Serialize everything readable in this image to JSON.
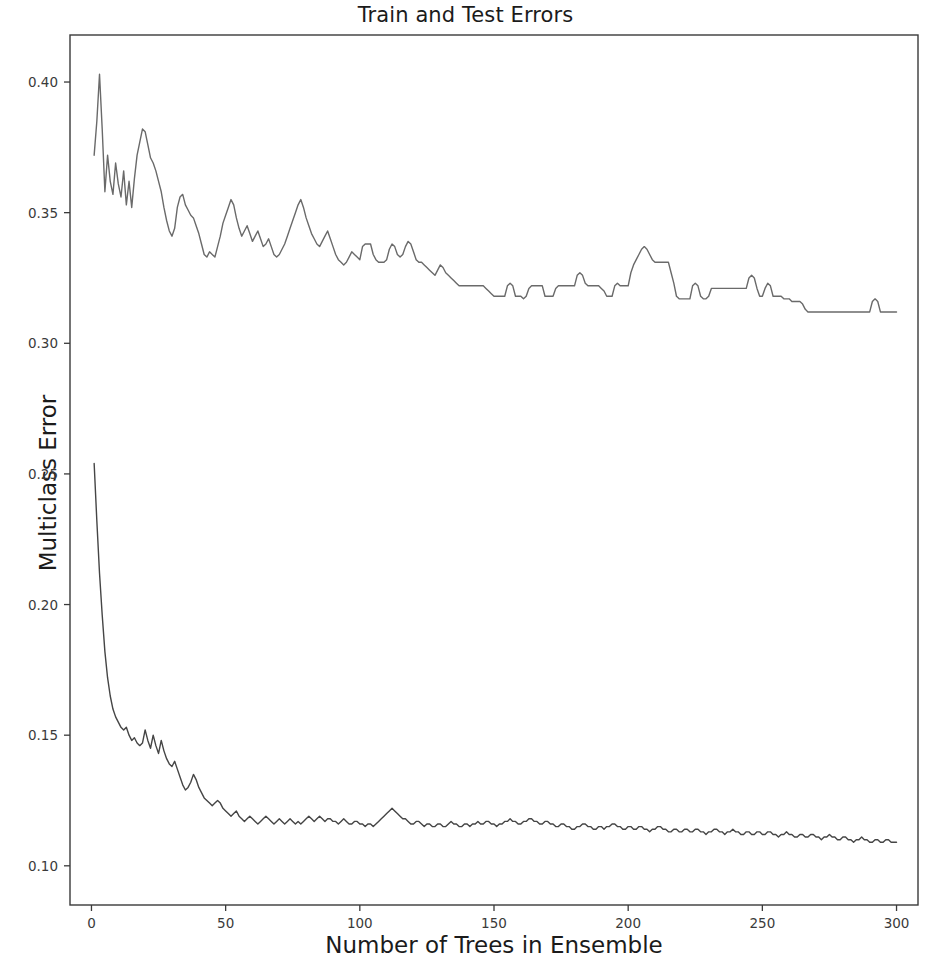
{
  "chart_data": {
    "type": "line",
    "title": "Train and Test Errors",
    "xlabel": "Number of Trees in Ensemble",
    "ylabel": "Multiclass Error",
    "xlim": [
      -8,
      308
    ],
    "ylim": [
      0.085,
      0.418
    ],
    "xticks": [
      0,
      50,
      100,
      150,
      200,
      250,
      300
    ],
    "xticklabels": [
      "0",
      "50",
      "100",
      "150",
      "200",
      "250",
      "300"
    ],
    "yticks": [
      0.1,
      0.15,
      0.2,
      0.25,
      0.3,
      0.35,
      0.4
    ],
    "yticklabels": [
      "0.10",
      "0.15",
      "0.20",
      "0.25",
      "0.30",
      "0.35",
      "0.40"
    ],
    "grid": false,
    "legend": null,
    "line_color": "#5f5f5f",
    "axis_color": "#3a3a3a",
    "background": "#ffffff",
    "series": [
      {
        "name": "Test Error",
        "color": "#6a6a6a",
        "x_start": 1,
        "x_step": 1,
        "values": [
          0.372,
          0.385,
          0.403,
          0.382,
          0.358,
          0.372,
          0.362,
          0.357,
          0.369,
          0.361,
          0.356,
          0.366,
          0.353,
          0.362,
          0.352,
          0.363,
          0.372,
          0.377,
          0.382,
          0.381,
          0.376,
          0.371,
          0.369,
          0.366,
          0.362,
          0.358,
          0.352,
          0.347,
          0.343,
          0.341,
          0.344,
          0.352,
          0.356,
          0.357,
          0.353,
          0.351,
          0.349,
          0.348,
          0.345,
          0.342,
          0.338,
          0.334,
          0.333,
          0.335,
          0.334,
          0.333,
          0.337,
          0.341,
          0.346,
          0.349,
          0.352,
          0.355,
          0.353,
          0.348,
          0.344,
          0.341,
          0.343,
          0.345,
          0.342,
          0.339,
          0.341,
          0.343,
          0.34,
          0.337,
          0.338,
          0.34,
          0.337,
          0.334,
          0.333,
          0.334,
          0.336,
          0.338,
          0.341,
          0.344,
          0.347,
          0.35,
          0.353,
          0.355,
          0.352,
          0.348,
          0.345,
          0.342,
          0.34,
          0.338,
          0.337,
          0.339,
          0.341,
          0.343,
          0.34,
          0.337,
          0.334,
          0.332,
          0.331,
          0.33,
          0.331,
          0.333,
          0.335,
          0.334,
          0.333,
          0.332,
          0.337,
          0.338,
          0.338,
          0.338,
          0.334,
          0.332,
          0.331,
          0.331,
          0.331,
          0.332,
          0.336,
          0.338,
          0.337,
          0.334,
          0.333,
          0.334,
          0.337,
          0.339,
          0.338,
          0.335,
          0.332,
          0.331,
          0.331,
          0.33,
          0.329,
          0.328,
          0.327,
          0.326,
          0.328,
          0.33,
          0.329,
          0.327,
          0.326,
          0.325,
          0.324,
          0.323,
          0.322,
          0.322,
          0.322,
          0.322,
          0.322,
          0.322,
          0.322,
          0.322,
          0.322,
          0.322,
          0.321,
          0.32,
          0.319,
          0.318,
          0.318,
          0.318,
          0.318,
          0.318,
          0.322,
          0.323,
          0.322,
          0.318,
          0.318,
          0.318,
          0.317,
          0.318,
          0.321,
          0.322,
          0.322,
          0.322,
          0.322,
          0.322,
          0.318,
          0.318,
          0.318,
          0.318,
          0.321,
          0.322,
          0.322,
          0.322,
          0.322,
          0.322,
          0.322,
          0.322,
          0.326,
          0.327,
          0.326,
          0.323,
          0.322,
          0.322,
          0.322,
          0.322,
          0.322,
          0.321,
          0.32,
          0.318,
          0.318,
          0.318,
          0.322,
          0.323,
          0.322,
          0.322,
          0.322,
          0.322,
          0.327,
          0.33,
          0.332,
          0.334,
          0.336,
          0.337,
          0.336,
          0.334,
          0.332,
          0.331,
          0.331,
          0.331,
          0.331,
          0.331,
          0.331,
          0.327,
          0.323,
          0.318,
          0.317,
          0.317,
          0.317,
          0.317,
          0.317,
          0.322,
          0.323,
          0.322,
          0.318,
          0.317,
          0.317,
          0.318,
          0.321,
          0.321,
          0.321,
          0.321,
          0.321,
          0.321,
          0.321,
          0.321,
          0.321,
          0.321,
          0.321,
          0.321,
          0.321,
          0.321,
          0.325,
          0.326,
          0.325,
          0.321,
          0.318,
          0.318,
          0.321,
          0.323,
          0.322,
          0.318,
          0.318,
          0.318,
          0.318,
          0.317,
          0.317,
          0.317,
          0.316,
          0.316,
          0.316,
          0.316,
          0.315,
          0.313,
          0.312,
          0.312,
          0.312,
          0.312,
          0.312,
          0.312,
          0.312,
          0.312,
          0.312,
          0.312,
          0.312,
          0.312,
          0.312,
          0.312,
          0.312,
          0.312,
          0.312,
          0.312,
          0.312,
          0.312,
          0.312,
          0.312,
          0.312,
          0.312,
          0.316,
          0.317,
          0.316,
          0.312,
          0.312,
          0.312,
          0.312,
          0.312,
          0.312,
          0.312
        ]
      },
      {
        "name": "Train Error",
        "color": "#454545",
        "x_start": 1,
        "x_step": 1,
        "values": [
          0.254,
          0.232,
          0.212,
          0.196,
          0.182,
          0.172,
          0.165,
          0.16,
          0.157,
          0.155,
          0.153,
          0.152,
          0.153,
          0.15,
          0.148,
          0.149,
          0.147,
          0.146,
          0.147,
          0.152,
          0.148,
          0.145,
          0.15,
          0.146,
          0.143,
          0.148,
          0.144,
          0.141,
          0.139,
          0.138,
          0.14,
          0.137,
          0.134,
          0.131,
          0.129,
          0.13,
          0.132,
          0.135,
          0.133,
          0.13,
          0.128,
          0.126,
          0.125,
          0.124,
          0.123,
          0.124,
          0.125,
          0.124,
          0.122,
          0.121,
          0.12,
          0.119,
          0.12,
          0.121,
          0.119,
          0.118,
          0.117,
          0.118,
          0.119,
          0.118,
          0.117,
          0.116,
          0.117,
          0.118,
          0.119,
          0.118,
          0.117,
          0.116,
          0.117,
          0.118,
          0.117,
          0.116,
          0.117,
          0.118,
          0.117,
          0.116,
          0.117,
          0.116,
          0.117,
          0.118,
          0.119,
          0.118,
          0.117,
          0.118,
          0.119,
          0.118,
          0.117,
          0.118,
          0.118,
          0.117,
          0.117,
          0.116,
          0.117,
          0.118,
          0.117,
          0.116,
          0.116,
          0.117,
          0.117,
          0.116,
          0.116,
          0.115,
          0.116,
          0.116,
          0.115,
          0.116,
          0.117,
          0.118,
          0.119,
          0.12,
          0.121,
          0.122,
          0.121,
          0.12,
          0.119,
          0.118,
          0.118,
          0.117,
          0.116,
          0.116,
          0.117,
          0.117,
          0.116,
          0.115,
          0.116,
          0.116,
          0.115,
          0.115,
          0.116,
          0.116,
          0.115,
          0.115,
          0.116,
          0.117,
          0.116,
          0.116,
          0.115,
          0.115,
          0.116,
          0.116,
          0.115,
          0.116,
          0.116,
          0.117,
          0.116,
          0.116,
          0.117,
          0.117,
          0.116,
          0.116,
          0.115,
          0.116,
          0.116,
          0.117,
          0.117,
          0.118,
          0.117,
          0.117,
          0.116,
          0.116,
          0.117,
          0.117,
          0.118,
          0.118,
          0.117,
          0.117,
          0.116,
          0.116,
          0.117,
          0.117,
          0.116,
          0.116,
          0.115,
          0.115,
          0.116,
          0.116,
          0.115,
          0.115,
          0.114,
          0.114,
          0.115,
          0.115,
          0.116,
          0.116,
          0.115,
          0.115,
          0.114,
          0.114,
          0.115,
          0.115,
          0.114,
          0.115,
          0.115,
          0.116,
          0.116,
          0.115,
          0.115,
          0.114,
          0.114,
          0.115,
          0.115,
          0.114,
          0.114,
          0.115,
          0.115,
          0.114,
          0.114,
          0.113,
          0.114,
          0.114,
          0.115,
          0.115,
          0.114,
          0.114,
          0.113,
          0.113,
          0.114,
          0.114,
          0.113,
          0.113,
          0.114,
          0.114,
          0.113,
          0.113,
          0.114,
          0.114,
          0.113,
          0.113,
          0.112,
          0.113,
          0.113,
          0.114,
          0.114,
          0.113,
          0.113,
          0.112,
          0.113,
          0.113,
          0.114,
          0.113,
          0.113,
          0.112,
          0.112,
          0.113,
          0.113,
          0.112,
          0.112,
          0.113,
          0.113,
          0.112,
          0.112,
          0.113,
          0.113,
          0.112,
          0.112,
          0.111,
          0.112,
          0.112,
          0.113,
          0.112,
          0.112,
          0.111,
          0.111,
          0.112,
          0.112,
          0.111,
          0.111,
          0.112,
          0.112,
          0.111,
          0.111,
          0.11,
          0.111,
          0.111,
          0.112,
          0.111,
          0.111,
          0.11,
          0.11,
          0.111,
          0.111,
          0.11,
          0.11,
          0.109,
          0.11,
          0.11,
          0.111,
          0.11,
          0.11,
          0.109,
          0.109,
          0.11,
          0.11,
          0.109,
          0.109,
          0.11,
          0.11,
          0.109,
          0.109,
          0.109
        ]
      }
    ]
  },
  "plot_geometry": {
    "left": 70,
    "right": 918,
    "top": 35,
    "bottom": 905
  }
}
